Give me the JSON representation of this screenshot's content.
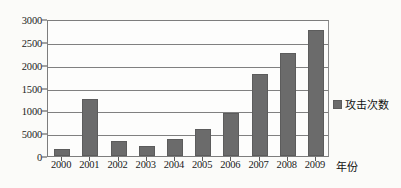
{
  "chart_data": {
    "type": "bar",
    "title": "",
    "xlabel": "年份",
    "ylabel": "",
    "categories": [
      "2000",
      "2001",
      "2002",
      "2003",
      "2004",
      "2005",
      "2006",
      "2007",
      "2008",
      "2009"
    ],
    "values": [
      150,
      1240,
      330,
      220,
      370,
      600,
      950,
      1800,
      2250,
      2770
    ],
    "series": [
      {
        "name": "攻击次数",
        "values": [
          150,
          1240,
          330,
          220,
          370,
          600,
          950,
          1800,
          2250,
          2770
        ]
      }
    ],
    "ylim": [
      0,
      3000
    ],
    "ytick_values": [
      0,
      500,
      1000,
      1500,
      2000,
      2500,
      3000
    ],
    "ytick_labels": [
      "0",
      "5000",
      "1000",
      "1500",
      "2000",
      "2500",
      "3000"
    ],
    "grid": true,
    "legend_position": "right",
    "legend": [
      "攻击次数"
    ],
    "bar_color": "#6b6b6b",
    "gridline_color": "#808080",
    "axis_color": "#7d7d7d",
    "background_color": "#fbfbf9"
  }
}
